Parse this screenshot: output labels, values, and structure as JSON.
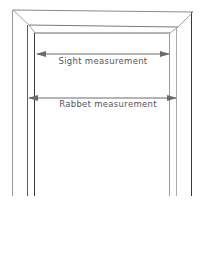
{
  "diagram": {
    "labels": {
      "sight": "Sight measurement",
      "rabbet": "Rabbet measurement"
    },
    "colors": {
      "line": "#4a4a4a",
      "light_line": "#9a9a9a",
      "arrow": "#6a6a6a",
      "text": "#555555",
      "background": "#ffffff"
    }
  }
}
